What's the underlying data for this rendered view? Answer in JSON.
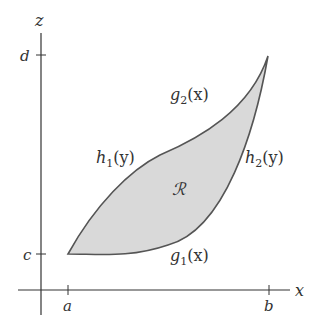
{
  "axes": {
    "x_label": "x",
    "z_label": "z",
    "x_ticks": [
      "a",
      "b"
    ],
    "z_ticks": [
      "c",
      "d"
    ]
  },
  "curves": {
    "g1": {
      "name": "g",
      "sub": "1",
      "arg": "(x)"
    },
    "g2": {
      "name": "g",
      "sub": "2",
      "arg": "(x)"
    },
    "h1": {
      "name": "h",
      "sub": "1",
      "arg": "(y)"
    },
    "h2": {
      "name": "h",
      "sub": "2",
      "arg": "(y)"
    }
  },
  "region": {
    "label": "ℛ",
    "fill": "#d9d9d9",
    "stroke": "#555555"
  }
}
